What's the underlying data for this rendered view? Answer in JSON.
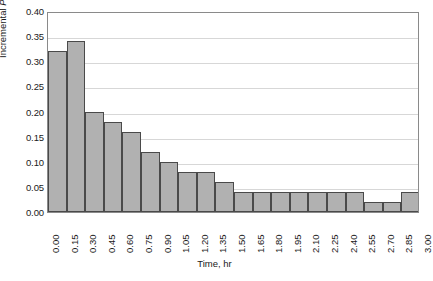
{
  "chart_data": {
    "type": "bar",
    "title": "",
    "xlabel": "Time, hr",
    "ylabel": "Incremental P, in.",
    "ylabel_parts": {
      "pre": "Incremental ",
      "italic": "P",
      "post": ", in."
    },
    "ylim": [
      0.0,
      0.4
    ],
    "ytick_step": 0.05,
    "yticks": [
      "0.00",
      "0.05",
      "0.10",
      "0.15",
      "0.20",
      "0.25",
      "0.30",
      "0.35",
      "0.40"
    ],
    "ytick_values": [
      0.0,
      0.05,
      0.1,
      0.15,
      0.2,
      0.25,
      0.3,
      0.35,
      0.4
    ],
    "xlim": [
      0.0,
      3.0
    ],
    "xtick_step": 0.15,
    "xticks": [
      "0.00",
      "0.15",
      "0.30",
      "0.45",
      "0.60",
      "0.75",
      "0.90",
      "1.05",
      "1.20",
      "1.35",
      "1.50",
      "1.65",
      "1.80",
      "1.95",
      "2.10",
      "2.25",
      "2.40",
      "2.55",
      "2.70",
      "2.85",
      "3.00"
    ],
    "xtick_values": [
      0.0,
      0.15,
      0.3,
      0.45,
      0.6,
      0.75,
      0.9,
      1.05,
      1.2,
      1.35,
      1.5,
      1.65,
      1.8,
      1.95,
      2.1,
      2.25,
      2.4,
      2.55,
      2.7,
      2.85,
      3.0
    ],
    "bar_interval": 0.15,
    "bin_edges": [
      0.0,
      0.15,
      0.3,
      0.45,
      0.6,
      0.75,
      0.9,
      1.05,
      1.2,
      1.35,
      1.5,
      1.65,
      1.8,
      1.95,
      2.1,
      2.25,
      2.4,
      2.55,
      2.7,
      2.85,
      3.0
    ],
    "categories": [
      "0.00-0.15",
      "0.15-0.30",
      "0.30-0.45",
      "0.45-0.60",
      "0.60-0.75",
      "0.75-0.90",
      "0.90-1.05",
      "1.05-1.20",
      "1.20-1.35",
      "1.35-1.50",
      "1.50-1.65",
      "1.65-1.80",
      "1.80-1.95",
      "1.95-2.10",
      "2.10-2.25",
      "2.25-2.40",
      "2.40-2.55",
      "2.55-2.70",
      "2.70-2.85",
      "2.85-3.00"
    ],
    "values": [
      0.32,
      0.34,
      0.2,
      0.18,
      0.16,
      0.12,
      0.1,
      0.08,
      0.08,
      0.06,
      0.04,
      0.04,
      0.04,
      0.04,
      0.04,
      0.04,
      0.04,
      0.02,
      0.02,
      0.04
    ],
    "grid": {
      "horizontal": true,
      "vertical": false
    },
    "legend": null,
    "legend_position": "none",
    "colors": {
      "bar_fill": "#b1b1b1",
      "bar_stroke": "#4a4a4a",
      "gridline": "#d7d7d7",
      "frame": "#8a8a8a",
      "background": "#ffffff",
      "text": "#1a1a1a"
    }
  }
}
